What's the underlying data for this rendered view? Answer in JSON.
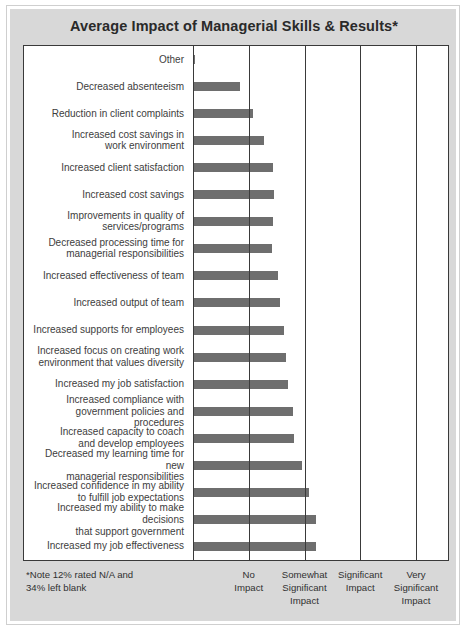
{
  "chart_data": {
    "type": "bar",
    "orientation": "horizontal",
    "title": "Average Impact of Managerial Skills & Results*",
    "xlabel": "",
    "ylabel": "",
    "xlim": [
      0,
      4
    ],
    "grid": true,
    "legend": null,
    "note": "*Note 12% rated N/A and 34% left blank",
    "tick_labels": [
      "No Impact",
      "Somewhat Significant Impact",
      "Significant Impact",
      "Very Significant Impact"
    ],
    "tick_labels_wrapped": [
      [
        "No",
        "Impact"
      ],
      [
        "Somewhat",
        "Significant",
        "Impact"
      ],
      [
        "Significant",
        "Impact"
      ],
      [
        "Very",
        "Significant",
        "Impact"
      ]
    ],
    "tick_values": [
      1,
      2,
      3,
      4
    ],
    "bar_color": "#6e6e6e",
    "categories": [
      "Other",
      "Decreased absenteeism",
      "Reduction in client complaints",
      "Increased cost savings in work environment",
      "Increased client satisfaction",
      "Increased cost savings",
      "Improvements in quality of services/programs",
      "Decreased processing time for managerial responsibilities",
      "Increased effectiveness of team",
      "Increased output of team",
      "Increased supports for employees",
      "Increased focus on creating work environment that values diversity",
      "Increased my job satisfaction",
      "Increased compliance with government policies and procedures",
      "Increased capacity to coach and develop employees",
      "Decreased my learning time for new managerial responsibilities",
      "Increased confidence in my ability to fulfill job expectations",
      "Increased my ability to make decisions that support government",
      "Increased my job effectiveness"
    ],
    "categories_wrapped": [
      [
        "Other"
      ],
      [
        "Decreased absenteeism"
      ],
      [
        "Reduction in client complaints"
      ],
      [
        "Increased cost savings in",
        "work environment"
      ],
      [
        "Increased client satisfaction"
      ],
      [
        "Increased cost savings"
      ],
      [
        "Improvements in quality of",
        "services/programs"
      ],
      [
        "Decreased processing time for",
        "managerial responsibilities"
      ],
      [
        "Increased effectiveness of team"
      ],
      [
        "Increased output of team"
      ],
      [
        "Increased supports for employees"
      ],
      [
        "Increased focus on creating work",
        "environment that values diversity"
      ],
      [
        "Increased my job satisfaction"
      ],
      [
        "Increased compliance with",
        "government policies and procedures"
      ],
      [
        "Increased capacity to coach",
        "and develop employees"
      ],
      [
        "Decreased my learning time for new",
        "managerial responsibilities"
      ],
      [
        "Increased confidence in my ability",
        "to fulfill job expectations"
      ],
      [
        "Increased my ability to make decisions",
        "that support government"
      ],
      [
        "Increased my job effectiveness"
      ]
    ],
    "values": [
      0.04,
      0.85,
      1.07,
      1.28,
      1.44,
      1.46,
      1.44,
      1.42,
      1.52,
      1.56,
      1.64,
      1.66,
      1.7,
      1.79,
      1.82,
      1.95,
      2.08,
      2.2,
      2.2
    ]
  }
}
